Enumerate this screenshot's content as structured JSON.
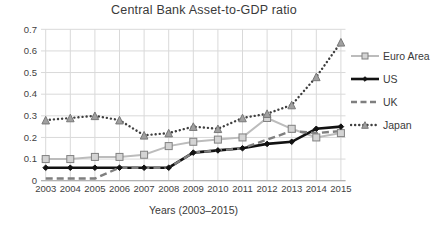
{
  "chart_data": {
    "type": "line",
    "title": "Central Bank Asset-to-GDP ratio",
    "xlabel": "Years (2003–2015)",
    "ylabel": "",
    "x_labels": [
      "2003",
      "2004",
      "2005",
      "2006",
      "2007",
      "2008",
      "2009",
      "2010",
      "2011",
      "2012",
      "2013",
      "2014",
      "2015"
    ],
    "ylim": [
      0,
      0.7
    ],
    "ytick_values": [
      0,
      0.1,
      0.2,
      0.3,
      0.4,
      0.5,
      0.6,
      0.7
    ],
    "ytick_labels": [
      "0",
      "0.1",
      "0.2",
      "0.3",
      "0.4",
      "0.5",
      "0.6",
      "0.7"
    ],
    "grid": true,
    "legend_position": "right",
    "series": [
      {
        "name": "Euro Area",
        "color": "#bcbcbc",
        "line_style": "solid",
        "marker": "square",
        "marker_fill": "#d4d4d4",
        "marker_edge": "#808080",
        "values": [
          0.1,
          0.1,
          0.11,
          0.11,
          0.12,
          0.16,
          0.18,
          0.19,
          0.2,
          0.29,
          0.24,
          0.2,
          0.22
        ]
      },
      {
        "name": "US",
        "color": "#121212",
        "line_style": "solid",
        "marker": "diamond",
        "marker_fill": "#121212",
        "marker_edge": "#121212",
        "values": [
          0.06,
          0.06,
          0.06,
          0.06,
          0.06,
          0.06,
          0.13,
          0.14,
          0.15,
          0.17,
          0.18,
          0.24,
          0.25
        ]
      },
      {
        "name": "UK",
        "color": "#7f7f7f",
        "line_style": "dashed",
        "marker": "none",
        "marker_fill": "",
        "marker_edge": "",
        "values": [
          0.01,
          0.01,
          0.01,
          0.06,
          0.06,
          0.06,
          0.13,
          0.14,
          0.15,
          0.19,
          0.23,
          0.22,
          0.23
        ]
      },
      {
        "name": "Japan",
        "color": "#3f3f3f",
        "line_style": "dotted",
        "marker": "triangle",
        "marker_fill": "#a0a0a0",
        "marker_edge": "#787878",
        "values": [
          0.28,
          0.29,
          0.3,
          0.28,
          0.21,
          0.22,
          0.25,
          0.24,
          0.29,
          0.31,
          0.35,
          0.48,
          0.64
        ]
      }
    ],
    "gridline_color": "#d9d9d9",
    "axis_line_color": "#b3b3b3",
    "tick_label_color": "#3f3f3f"
  }
}
